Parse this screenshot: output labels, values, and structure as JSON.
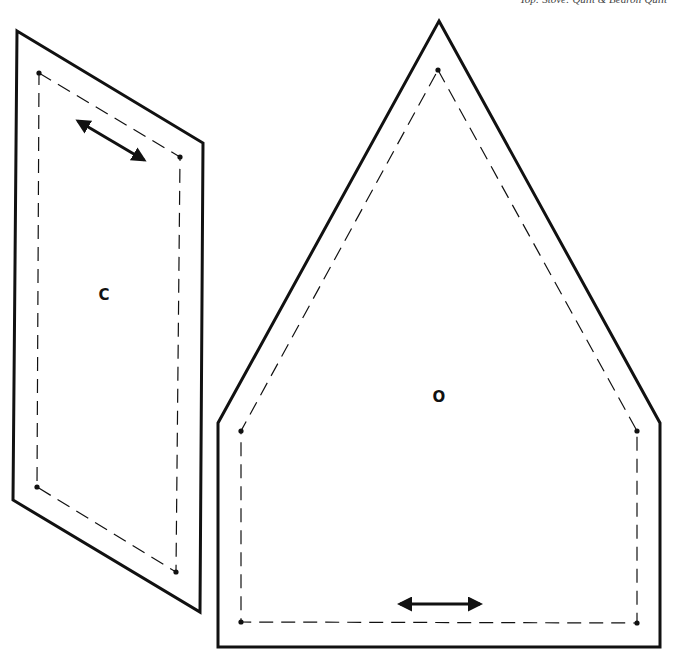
{
  "header": {
    "text": "Top: Stove: Quilt & Bedroll Quilt"
  },
  "colors": {
    "stroke": "#111111",
    "background": "#ffffff"
  },
  "pieces": [
    {
      "id": "C",
      "label": "C",
      "label_pos": [
        104,
        300
      ],
      "outer": [
        [
          17,
          31
        ],
        [
          203,
          143
        ],
        [
          200,
          612
        ],
        [
          13,
          500
        ]
      ],
      "seam": [
        [
          39,
          73
        ],
        [
          180,
          157
        ],
        [
          176,
          572
        ],
        [
          37,
          487
        ]
      ],
      "grain_arrow": [
        [
          78,
          121
        ],
        [
          144,
          160
        ]
      ]
    },
    {
      "id": "O",
      "label": "O",
      "label_pos": [
        439,
        402
      ],
      "outer": [
        [
          439,
          21
        ],
        [
          660,
          423
        ],
        [
          660,
          647
        ],
        [
          218,
          647
        ],
        [
          218,
          423
        ]
      ],
      "seam": [
        [
          438,
          70
        ],
        [
          637,
          431
        ],
        [
          637,
          623
        ],
        [
          241,
          622
        ],
        [
          241,
          431
        ]
      ],
      "grain_arrow": [
        [
          400,
          604
        ],
        [
          480,
          604
        ]
      ]
    }
  ]
}
